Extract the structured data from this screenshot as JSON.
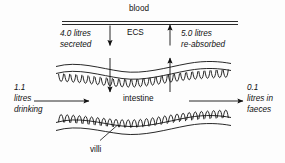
{
  "diagram": {
    "title_region": "intestinal water balance",
    "labels": {
      "blood": "blood",
      "ecs": "ECS",
      "intestine": "intestine",
      "villi": "villi",
      "secreted_amount": "4.0 litres",
      "secreted_word": "secreted",
      "reabsorbed_amount": "5.0 litres",
      "reabsorbed_word": "re-absorbed",
      "drinking_line1": "1.1",
      "drinking_line2": "litres",
      "drinking_line3": "drinking",
      "faeces_line1": "0.1",
      "faeces_line2": "litres in",
      "faeces_line3": "faeces"
    },
    "colors": {
      "stroke": "#111111",
      "text": "#111111",
      "background": "#fdfdfd"
    },
    "arrows": {
      "secretion_direction": "down",
      "reabsorption_direction": "up",
      "drinking_direction": "right",
      "faeces_direction": "right"
    }
  }
}
